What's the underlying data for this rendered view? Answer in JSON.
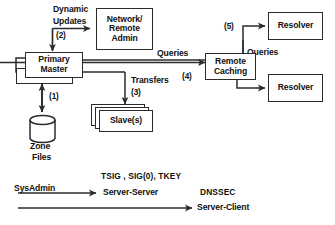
{
  "diagram": {
    "nodes": {
      "network_admin": {
        "lines": [
          "Network/",
          "Remote",
          "Admin"
        ]
      },
      "primary_master": {
        "lines": [
          "Primary",
          "Master"
        ]
      },
      "master": {
        "lines": [
          "Master"
        ]
      },
      "slaves": {
        "lines": [
          "Slave(s)"
        ]
      },
      "remote_caching": {
        "lines": [
          "Remote",
          "Caching"
        ]
      },
      "resolver_top": {
        "lines": [
          "Resolver"
        ]
      },
      "resolver_bottom": {
        "lines": [
          "Resolver"
        ]
      },
      "zone_files": {
        "lines": [
          "Zone",
          "Files"
        ]
      }
    },
    "labels": {
      "dynamic_updates_l1": "Dynamic",
      "dynamic_updates_l2": "Updates",
      "step2": "(2)",
      "step1": "(1)",
      "transfers": "Transfers",
      "step3": "(3)",
      "queries_left": "Queries",
      "step4": "(4)",
      "step5": "(5)",
      "queries_right": "Queries"
    },
    "legend": {
      "sysadmin": "SysAdmin",
      "server_server_title": "TSIG , SIG(0), TKEY",
      "server_server_sub": "Server-Server",
      "server_client_title": "DNSSEC",
      "server_client_sub": "Server-Client"
    },
    "colors": {
      "stroke": "#2b2b2b",
      "text": "#111111",
      "background": "#ffffff"
    }
  }
}
